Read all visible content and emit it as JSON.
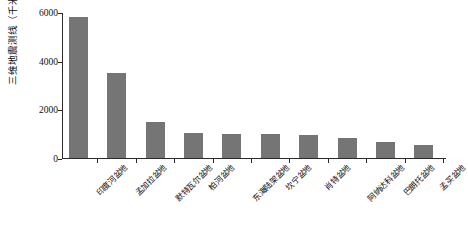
{
  "chart_data": {
    "type": "bar",
    "title": "",
    "subtitle": "",
    "xlabel": "",
    "ylabel": "三维地震测线（千米）",
    "ylim": [
      0,
      6000
    ],
    "ytick_values": [
      0,
      2000,
      4000,
      6000
    ],
    "ytick_labels": [
      "0",
      "2000",
      "4000",
      "6000"
    ],
    "grid": false,
    "legend": false,
    "bar_color": "#757575",
    "axis_color": "#2a2a2a",
    "categories": [
      "印度河盆地",
      "孟加拉盆地",
      "默特瓦尔盆地",
      "柏河盆地",
      "东海陆架盆地",
      "坎宁盆地",
      "肖特盆地",
      "阿纳达科盆地",
      "巴朗托盆地",
      "孟买盆地"
    ],
    "values": [
      5780,
      3510,
      1490,
      1010,
      1000,
      990,
      930,
      830,
      650,
      540
    ]
  }
}
